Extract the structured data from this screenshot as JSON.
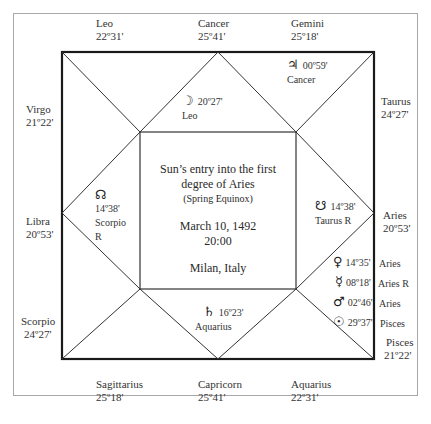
{
  "chart": {
    "title_line1": "Sun’s entry into the first",
    "title_line2": "degree of Aries",
    "subtitle": "(Spring Equinox)",
    "date": "March 10, 1492",
    "time": "20:00",
    "place": "Milan, Italy"
  },
  "cusps": {
    "top_left": {
      "sign": "Leo",
      "degree": "22º31'"
    },
    "top_center": {
      "sign": "Cancer",
      "degree": "25º41'"
    },
    "top_right": {
      "sign": "Gemini",
      "degree": "25º18'"
    },
    "left_upper": {
      "sign": "Virgo",
      "degree": "21º22'"
    },
    "left_middle": {
      "sign": "Libra",
      "degree": "20º53'"
    },
    "left_lower": {
      "sign": "Scorpio",
      "degree": "24º27'"
    },
    "right_upper": {
      "sign": "Taurus",
      "degree": "24º27'"
    },
    "right_middle": {
      "sign": "Aries",
      "degree": "20º53'"
    },
    "right_lower": {
      "sign": "Pisces",
      "degree": "21º22'"
    },
    "bottom_left": {
      "sign": "Sagittarius",
      "degree": "25º18'"
    },
    "bottom_center": {
      "sign": "Capricorn",
      "degree": "25º41'"
    },
    "bottom_right": {
      "sign": "Aquarius",
      "degree": "22º31'"
    }
  },
  "planets": {
    "jupiter": {
      "glyph": "♃",
      "degree": "00º59'",
      "sign": "Cancer"
    },
    "moon": {
      "glyph": "☽",
      "degree": "20º27'",
      "sign": "Leo"
    },
    "north_node": {
      "glyph": "☊",
      "degree": "14º38'",
      "sign": "Scorpio",
      "retro": "R"
    },
    "south_node": {
      "glyph": "☋",
      "degree": "14º38'",
      "sign": "Taurus R"
    },
    "saturn": {
      "glyph": "♄",
      "degree": "16º23'",
      "sign": "Aquarius"
    },
    "venus": {
      "glyph": "♀",
      "degree": "14º35'",
      "sign": "Aries"
    },
    "mercury": {
      "glyph": "☿",
      "degree": "08º18'",
      "sign": "Aries R"
    },
    "mars": {
      "glyph": "♂",
      "degree": "02º46'",
      "sign": "Aries"
    },
    "sun": {
      "glyph": "☉",
      "degree": "29º37'",
      "sign": "Pisces"
    }
  }
}
